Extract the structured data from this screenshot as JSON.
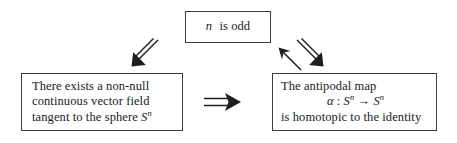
{
  "diagram": {
    "boxes": {
      "premise": {
        "name": "n-is-odd",
        "lines": [
          {
            "math": "n",
            "text": " is odd"
          }
        ]
      },
      "vector_field": {
        "name": "non-null-vector-field",
        "lines": [
          {
            "text": "There exists a non-null"
          },
          {
            "text": "continuous vector field"
          },
          {
            "text_before": "tangent to the sphere ",
            "math": "S",
            "sup": "n",
            "text_after": ""
          }
        ]
      },
      "antipodal": {
        "name": "antipodal-map-homotopic",
        "lines": [
          {
            "text": "The antipodal map"
          },
          {
            "math_alpha": "α",
            "colon": " : ",
            "math1": "S",
            "sup1": "n",
            "arrow": " → ",
            "math2": "S",
            "sup2": "n"
          },
          {
            "text": "is homotopic to the identity"
          }
        ]
      }
    },
    "arrows": [
      {
        "name": "implies-down-left",
        "glyph": "⇙",
        "direction": "down-left",
        "style": "double"
      },
      {
        "name": "implies-down-right",
        "glyph": "⇘",
        "direction": "down-right",
        "style": "double"
      },
      {
        "name": "implies-up-left",
        "glyph": "↖",
        "direction": "up-left",
        "style": "single"
      },
      {
        "name": "implies-right",
        "glyph": "⇒",
        "direction": "right",
        "style": "double"
      }
    ],
    "colors": {
      "ink": "#1f1f1f",
      "border": "#3d3d3d",
      "background": "#ffffff"
    }
  }
}
